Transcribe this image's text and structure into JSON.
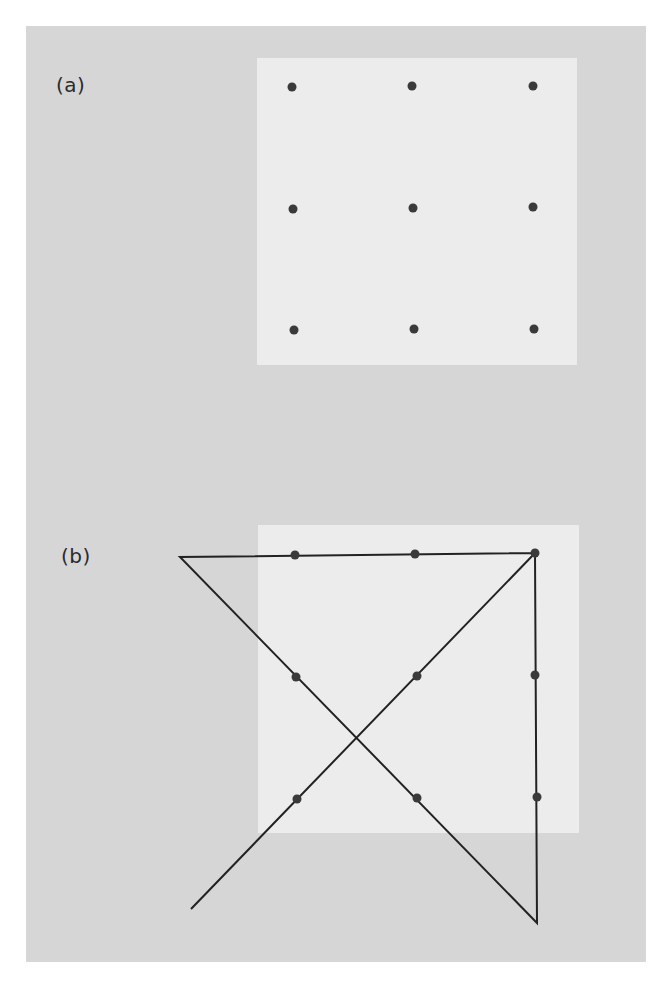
{
  "figure": {
    "colors": {
      "page_background": "#ffffff",
      "panel_background": "#d6d6d6",
      "grid_square": "#ececec",
      "dot": "#3a3a3a",
      "line": "#222222"
    },
    "panels": [
      {
        "id": "a",
        "label": "(a)",
        "description": "3x3 grid of nine dots inside a light square",
        "square": {
          "x": 257,
          "y": 58,
          "width": 320,
          "height": 307
        },
        "dots": [
          {
            "x": 292,
            "y": 87
          },
          {
            "x": 412,
            "y": 86
          },
          {
            "x": 533,
            "y": 86
          },
          {
            "x": 293,
            "y": 209
          },
          {
            "x": 413,
            "y": 208
          },
          {
            "x": 533,
            "y": 207
          },
          {
            "x": 294,
            "y": 330
          },
          {
            "x": 414,
            "y": 329
          },
          {
            "x": 534,
            "y": 329
          }
        ],
        "lines": []
      },
      {
        "id": "b",
        "label": "(b)",
        "description": "Solution: four connected straight lines passing through all nine dots, extending beyond the square",
        "square": {
          "x": 258,
          "y": 525,
          "width": 321,
          "height": 308
        },
        "dots": [
          {
            "x": 295,
            "y": 555
          },
          {
            "x": 415,
            "y": 554
          },
          {
            "x": 535,
            "y": 553
          },
          {
            "x": 296,
            "y": 677
          },
          {
            "x": 417,
            "y": 676
          },
          {
            "x": 535,
            "y": 675
          },
          {
            "x": 297,
            "y": 799
          },
          {
            "x": 417,
            "y": 798
          },
          {
            "x": 537,
            "y": 797
          }
        ],
        "polyline": [
          {
            "x": 191,
            "y": 909
          },
          {
            "x": 535,
            "y": 553
          },
          {
            "x": 537,
            "y": 923
          },
          {
            "x": 180,
            "y": 557
          },
          {
            "x": 535,
            "y": 553
          }
        ]
      }
    ]
  }
}
